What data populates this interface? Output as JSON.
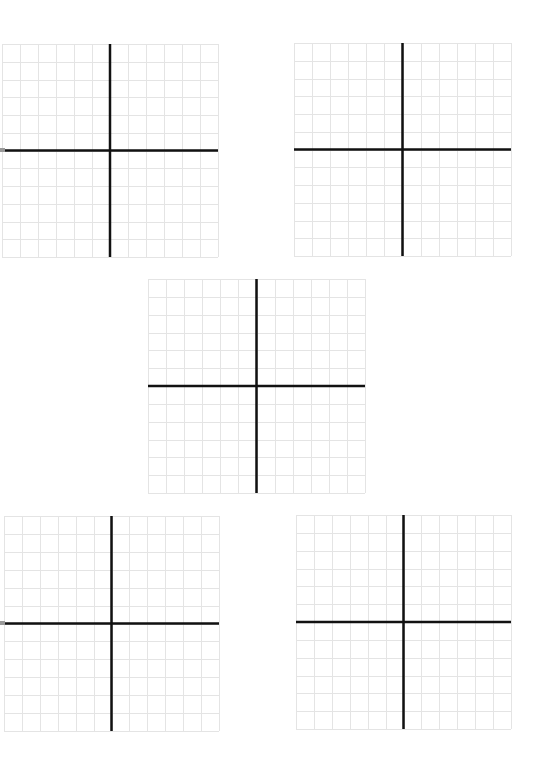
{
  "page": {
    "width": 541,
    "height": 770,
    "background": "#ffffff"
  },
  "style": {
    "grid_line_color": "#e4e4e4",
    "axis_color": "#111111",
    "grid_line_width": 1,
    "axis_line_width": 2.5
  },
  "grids": [
    {
      "id": "grid-top-left",
      "left": 2,
      "top": 44,
      "width": 216,
      "height": 213,
      "cols": 12,
      "rows": 12,
      "axis_x_col": 6,
      "axis_y_row": 6,
      "axis_extend_left": 2
    },
    {
      "id": "grid-top-right",
      "left": 294,
      "top": 43,
      "width": 217,
      "height": 213,
      "cols": 12,
      "rows": 12,
      "axis_x_col": 6,
      "axis_y_row": 6,
      "axis_extend_left": 0
    },
    {
      "id": "grid-middle",
      "left": 148,
      "top": 279,
      "width": 217,
      "height": 214,
      "cols": 12,
      "rows": 12,
      "axis_x_col": 6,
      "axis_y_row": 6,
      "axis_extend_left": 0
    },
    {
      "id": "grid-bottom-left",
      "left": 4,
      "top": 516,
      "width": 215,
      "height": 215,
      "cols": 12,
      "rows": 12,
      "axis_x_col": 6,
      "axis_y_row": 6,
      "axis_extend_left": 0
    },
    {
      "id": "grid-bottom-right",
      "left": 296,
      "top": 515,
      "width": 215,
      "height": 214,
      "cols": 12,
      "rows": 12,
      "axis_x_col": 6,
      "axis_y_row": 6,
      "axis_extend_left": 0
    }
  ],
  "edge_marks": [
    {
      "id": "edge-mark-top",
      "left": 0,
      "top": 148
    },
    {
      "id": "edge-mark-bottom",
      "left": 0,
      "top": 621
    }
  ]
}
